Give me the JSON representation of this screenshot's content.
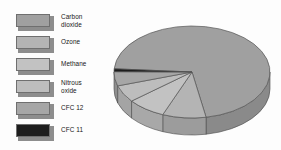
{
  "figure": {
    "title": "",
    "background_color": "#fdfdfd"
  },
  "legend": {
    "position": "left",
    "items": [
      {
        "label": "Carbon\ndioxide",
        "color": "#a0a0a0",
        "lines": 2,
        "name": "carbon-dioxide"
      },
      {
        "label": "Ozone",
        "color": "#b4b4b4",
        "lines": 1,
        "name": "ozone"
      },
      {
        "label": "Methane",
        "color": "#c2c2c2",
        "lines": 1,
        "name": "methane"
      },
      {
        "label": "Nitrous\noxide",
        "color": "#bdbdbd",
        "lines": 2,
        "name": "nitrous-oxide"
      },
      {
        "label": "CFC 12",
        "color": "#a6a6a6",
        "lines": 1,
        "name": "cfc-12"
      },
      {
        "label": "CFC 11",
        "color": "#1d1d1d",
        "lines": 1,
        "name": "cfc-11"
      }
    ]
  },
  "chart_data": {
    "type": "pie",
    "title": "",
    "style": "3d-pie",
    "legend_position": "left",
    "grid": false,
    "labels": [
      "Carbon dioxide",
      "Ozone",
      "Methane",
      "Nitrous oxide",
      "CFC 12",
      "CFC 11"
    ],
    "values": [
      71,
      9,
      8,
      6,
      5,
      1
    ],
    "units": "percent",
    "colors": [
      "#a0a0a0",
      "#b4b4b4",
      "#c2c2c2",
      "#bdbdbd",
      "#a6a6a6",
      "#1d1d1d"
    ],
    "side_colors": [
      "#8a8a8a",
      "#9c9c9c",
      "#a8a8a8",
      "#a4a4a4",
      "#8f8f8f",
      "#121212"
    ],
    "geometry": {
      "center_x": 84,
      "center_y": 58,
      "radius_x": 78,
      "radius_y": 46,
      "depth": 17,
      "start_angle_deg": 184
    }
  }
}
